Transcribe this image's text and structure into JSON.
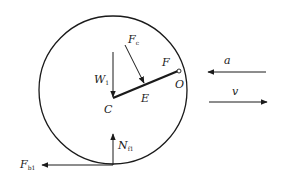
{
  "diagram": {
    "type": "free-body diagram",
    "colors": {
      "stroke": "#1a1a1a",
      "background": "#ffffff"
    },
    "points": {
      "C": {
        "label": "C"
      },
      "E": {
        "label": "E"
      },
      "O": {
        "label": "O"
      },
      "F": {
        "label": "F"
      }
    },
    "forces": {
      "W1": {
        "main": "W",
        "sub": "1",
        "direction": "down"
      },
      "Fc": {
        "main": "F",
        "sub": "c",
        "direction": "down-right"
      },
      "N": {
        "main": "N",
        "sub": "f1",
        "direction": "up"
      },
      "Fb": {
        "main": "F",
        "sub": "b1",
        "direction": "left"
      }
    },
    "kinematics": {
      "a": {
        "label": "a",
        "direction": "left"
      },
      "v": {
        "label": "v",
        "direction": "right"
      }
    }
  }
}
